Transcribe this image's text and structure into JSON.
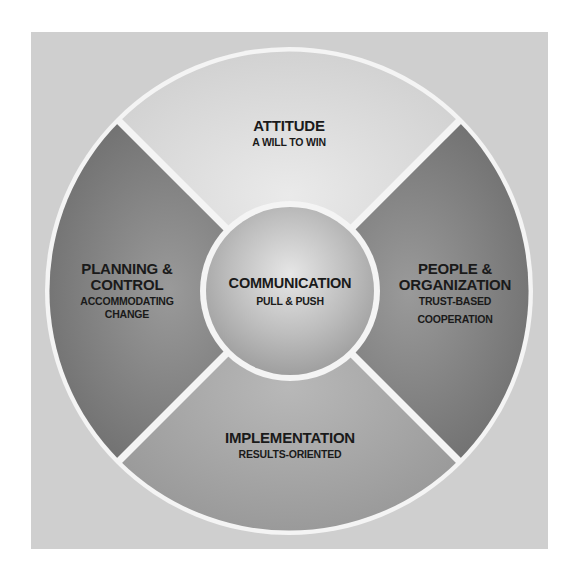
{
  "diagram": {
    "type": "wheel",
    "center": {
      "title": "COMMUNICATION",
      "subtitle": "PULL & PUSH"
    },
    "segments": [
      {
        "position": "top",
        "title": "ATTITUDE",
        "subtitle": "A WILL TO WIN",
        "color": "#d9d9d9"
      },
      {
        "position": "left",
        "title_line1": "PLANNING &",
        "title_line2": "CONTROL",
        "subtitle_line1": "ACCOMMODATING",
        "subtitle_line2": "CHANGE",
        "color": "#7d7d7d"
      },
      {
        "position": "right",
        "title_line1": "PEOPLE &",
        "title_line2": "ORGANIZATION",
        "subtitle_line1": "TRUST-BASED",
        "subtitle_line2": "COOPERATION",
        "color": "#7d7d7d"
      },
      {
        "position": "bottom",
        "title": "IMPLEMENTATION",
        "subtitle": "RESULTS-ORIENTED",
        "color": "#a6a6a6"
      }
    ],
    "colors": {
      "background": "#cfcfcf",
      "separator": "#f4f4f4",
      "text": "#1a1a1a"
    }
  }
}
